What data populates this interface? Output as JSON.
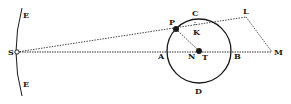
{
  "diagram": {
    "type": "geometric-astronomy-figure",
    "labels": {
      "S": "S",
      "E_top": "E",
      "E_bottom": "E",
      "P": "P",
      "C": "C",
      "K": "K",
      "L": "L",
      "A": "A",
      "N": "N",
      "T": "T",
      "B": "B",
      "M": "M",
      "D": "D"
    },
    "colors": {
      "ink": "#1a1a1a",
      "background": "#ffffff"
    }
  }
}
